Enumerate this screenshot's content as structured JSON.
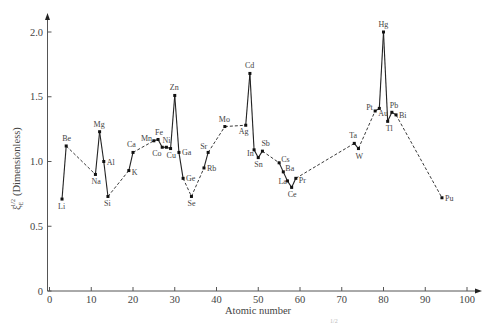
{
  "chart_data": {
    "type": "line",
    "title": "",
    "xlabel": "Atomic number",
    "ylabel": "ξ_E^{1/2} (Dimensionless)",
    "ylabel_symbol": "ξ",
    "ylabel_sub": "E",
    "ylabel_sup": "1/2",
    "ylabel_text": "(Dimensionless)",
    "xlim": [
      0,
      100
    ],
    "ylim": [
      0,
      2.0
    ],
    "xticks": [
      0,
      10,
      20,
      30,
      40,
      50,
      60,
      70,
      80,
      90,
      100
    ],
    "yticks": [
      0,
      0.5,
      1.0,
      1.5,
      2.0
    ],
    "ytick_labels": [
      "0",
      "0.5",
      "1.0",
      "1.5",
      "2.0"
    ],
    "grid": false,
    "legend": "none",
    "points": [
      {
        "el": "Li",
        "z": 3,
        "v": 0.71,
        "lx": -4,
        "ly": 10
      },
      {
        "el": "Be",
        "z": 4,
        "v": 1.12,
        "lx": -4,
        "ly": -5
      },
      {
        "el": "Na",
        "z": 11,
        "v": 0.9,
        "lx": -4,
        "ly": 10
      },
      {
        "el": "Mg",
        "z": 12,
        "v": 1.23,
        "lx": -6,
        "ly": -5
      },
      {
        "el": "Al",
        "z": 13,
        "v": 1.0,
        "lx": 3,
        "ly": 3
      },
      {
        "el": "Si",
        "z": 14,
        "v": 0.73,
        "lx": -4,
        "ly": 10
      },
      {
        "el": "K",
        "z": 19,
        "v": 0.93,
        "lx": 3,
        "ly": 4
      },
      {
        "el": "Ca",
        "z": 20,
        "v": 1.07,
        "lx": -6,
        "ly": -5
      },
      {
        "el": "Mn",
        "z": 25,
        "v": 1.16,
        "lx": -13,
        "ly": 0
      },
      {
        "el": "Fe",
        "z": 26,
        "v": 1.17,
        "lx": -3,
        "ly": -4
      },
      {
        "el": "Co",
        "z": 27,
        "v": 1.11,
        "lx": -10,
        "ly": 9
      },
      {
        "el": "Ni",
        "z": 28,
        "v": 1.11,
        "lx": -4,
        "ly": -4
      },
      {
        "el": "Cu",
        "z": 29,
        "v": 1.1,
        "lx": -4,
        "ly": 9
      },
      {
        "el": "Zn",
        "z": 30,
        "v": 1.51,
        "lx": -5,
        "ly": -5
      },
      {
        "el": "Ga",
        "z": 31,
        "v": 1.07,
        "lx": 3,
        "ly": 3
      },
      {
        "el": "Ge",
        "z": 32,
        "v": 0.87,
        "lx": 3,
        "ly": 3
      },
      {
        "el": "Se",
        "z": 34,
        "v": 0.73,
        "lx": -4,
        "ly": 10
      },
      {
        "el": "Rb",
        "z": 37,
        "v": 0.95,
        "lx": 3,
        "ly": 3
      },
      {
        "el": "Sr",
        "z": 38,
        "v": 1.07,
        "lx": -8,
        "ly": -3
      },
      {
        "el": "Mo",
        "z": 42,
        "v": 1.27,
        "lx": -6,
        "ly": -5
      },
      {
        "el": "Ag",
        "z": 47,
        "v": 1.28,
        "lx": -7,
        "ly": 9
      },
      {
        "el": "Cd",
        "z": 48,
        "v": 1.68,
        "lx": -5,
        "ly": -5
      },
      {
        "el": "In",
        "z": 49,
        "v": 1.09,
        "lx": -7,
        "ly": 6
      },
      {
        "el": "Sn",
        "z": 50,
        "v": 1.03,
        "lx": -4,
        "ly": 9
      },
      {
        "el": "Sb",
        "z": 51,
        "v": 1.08,
        "lx": -1,
        "ly": -5
      },
      {
        "el": "Cs",
        "z": 55,
        "v": 0.99,
        "lx": 2,
        "ly": -1
      },
      {
        "el": "Ba",
        "z": 56,
        "v": 0.92,
        "lx": 2,
        "ly": -1
      },
      {
        "el": "La",
        "z": 57,
        "v": 0.85,
        "lx": -9,
        "ly": 3
      },
      {
        "el": "Ce",
        "z": 58,
        "v": 0.8,
        "lx": -4,
        "ly": 10
      },
      {
        "el": "Pr",
        "z": 59,
        "v": 0.87,
        "lx": 3,
        "ly": 5
      },
      {
        "el": "Ta",
        "z": 73,
        "v": 1.14,
        "lx": -5,
        "ly": -5
      },
      {
        "el": "W",
        "z": 74,
        "v": 1.1,
        "lx": -3,
        "ly": 10
      },
      {
        "el": "Pt",
        "z": 78,
        "v": 1.39,
        "lx": -9,
        "ly": -1
      },
      {
        "el": "Au",
        "z": 79,
        "v": 1.41,
        "lx": -1,
        "ly": 8
      },
      {
        "el": "Hg",
        "z": 80,
        "v": 2.0,
        "lx": -5,
        "ly": -5
      },
      {
        "el": "Tl",
        "z": 81,
        "v": 1.31,
        "lx": -2,
        "ly": 10
      },
      {
        "el": "Pb",
        "z": 82,
        "v": 1.38,
        "lx": -2,
        "ly": -4
      },
      {
        "el": "Bi",
        "z": 83,
        "v": 1.36,
        "lx": 3,
        "ly": 3
      },
      {
        "el": "Pu",
        "z": 94,
        "v": 0.72,
        "lx": 3,
        "ly": 3
      }
    ],
    "segment_styles": [
      "solid",
      "dashed",
      "solid",
      "solid",
      "solid",
      "dashed",
      "solid",
      "dashed",
      "solid",
      "solid",
      "solid",
      "solid",
      "solid",
      "solid",
      "solid",
      "dashed",
      "dashed",
      "solid",
      "dashed",
      "dashed",
      "solid",
      "solid",
      "solid",
      "solid",
      "dashed",
      "solid",
      "solid",
      "solid",
      "solid",
      "dashed",
      "solid",
      "dashed",
      "solid",
      "solid",
      "solid",
      "solid",
      "solid",
      "dashed"
    ]
  },
  "caption_fragment": "1/2",
  "colors": {
    "line": "#222222",
    "axis": "#555555",
    "text": "#444444"
  }
}
